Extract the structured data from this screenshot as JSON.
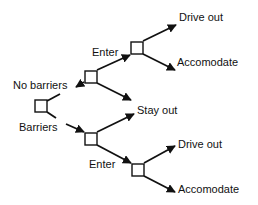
{
  "diagram": {
    "type": "decision-tree",
    "line_color": "#111111",
    "background": "#ffffff",
    "nodes": [
      {
        "id": "root",
        "kind": "decision"
      },
      {
        "id": "no-barriers",
        "kind": "decision"
      },
      {
        "id": "no-barriers-enter",
        "kind": "decision"
      },
      {
        "id": "barriers",
        "kind": "decision"
      },
      {
        "id": "barriers-enter",
        "kind": "decision"
      }
    ],
    "edges": [
      {
        "from": "root",
        "to": "no-barriers",
        "label": "No barriers"
      },
      {
        "from": "root",
        "to": "barriers",
        "label": "Barriers"
      },
      {
        "from": "no-barriers",
        "to": "no-barriers-enter",
        "label": "Enter"
      },
      {
        "from": "no-barriers",
        "to": "stay-out",
        "label": ""
      },
      {
        "from": "barriers",
        "to": "stay-out",
        "label": ""
      },
      {
        "from": "barriers",
        "to": "barriers-enter",
        "label": "Enter"
      },
      {
        "from": "no-barriers-enter",
        "to": "drive-out-top",
        "label": ""
      },
      {
        "from": "no-barriers-enter",
        "to": "accomodate-top",
        "label": ""
      },
      {
        "from": "barriers-enter",
        "to": "drive-out-bottom",
        "label": ""
      },
      {
        "from": "barriers-enter",
        "to": "accomodate-bottom",
        "label": ""
      }
    ],
    "labels": {
      "no_barriers": "No barriers",
      "barriers": "Barriers",
      "enter_top": "Enter",
      "enter_bottom": "Enter",
      "stay_out": "Stay out",
      "drive_out_top": "Drive out",
      "accomodate_top": "Accomodate",
      "drive_out_bottom": "Drive out",
      "accomodate_bottom": "Accomodate"
    }
  }
}
